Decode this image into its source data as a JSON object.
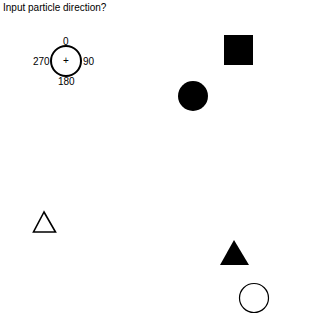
{
  "prompt": {
    "text": "Input particle direction?"
  },
  "dial": {
    "center_symbol": "+",
    "labels": {
      "top": "0",
      "right": "90",
      "bottom": "180",
      "left": "270"
    }
  },
  "shapes": [
    {
      "id": "filled-square",
      "type": "square",
      "fill": "#000000"
    },
    {
      "id": "filled-circle",
      "type": "circle",
      "fill": "#000000"
    },
    {
      "id": "outlined-triangle",
      "type": "triangle",
      "fill": "none"
    },
    {
      "id": "filled-triangle",
      "type": "triangle",
      "fill": "#000000"
    },
    {
      "id": "outlined-circle",
      "type": "circle",
      "fill": "none"
    }
  ]
}
